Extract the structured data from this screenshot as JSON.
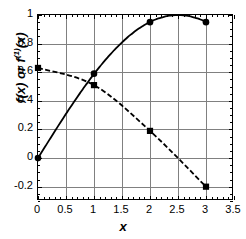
{
  "chart_data": {
    "type": "line",
    "title": "",
    "xlabel": "x",
    "ylabel": "f(x) or f(1)(x)",
    "ylabel_base": "f(x) or f",
    "ylabel_sup": "(1)",
    "ylabel_tail": "(x)",
    "xlim": [
      0,
      3.5
    ],
    "ylim": [
      -0.3,
      1.0
    ],
    "grid": true,
    "legend": "none",
    "xticks": [
      "0",
      "0.5",
      "1",
      "1.5",
      "2",
      "2.5",
      "3",
      "3.5"
    ],
    "xtick_values": [
      0,
      0.5,
      1,
      1.5,
      2,
      2.5,
      3,
      3.5
    ],
    "yticks": [
      "1",
      "0.8",
      "0.6",
      "0.4",
      "0.2",
      "0",
      "-0.2"
    ],
    "ytick_values": [
      1,
      0.8,
      0.6,
      0.4,
      0.2,
      0,
      -0.2
    ],
    "x": [
      0,
      1,
      2,
      3
    ],
    "series": [
      {
        "name": "f(x)",
        "marker": "circle",
        "linestyle": "solid",
        "color": "#000000",
        "values": [
          0.0,
          0.59,
          0.95,
          0.95
        ]
      },
      {
        "name": "f(1)(x)",
        "marker": "square",
        "linestyle": "dashed",
        "color": "#000000",
        "values": [
          0.63,
          0.51,
          0.19,
          -0.2
        ]
      }
    ]
  },
  "axes": {
    "frame_color": "#000000",
    "grid_color": "#808080"
  }
}
